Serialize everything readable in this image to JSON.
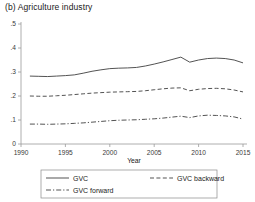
{
  "panel": {
    "label": "(b)  Agriculture industry"
  },
  "chart_data": {
    "type": "line",
    "title": "(b)  Agriculture industry",
    "xlabel": "Year",
    "ylabel": "",
    "xlim": [
      1990,
      2015
    ],
    "ylim": [
      0,
      0.5
    ],
    "grid": false,
    "legend_position": "bottom",
    "xticks": [
      1990,
      1995,
      2000,
      2005,
      2010,
      2015
    ],
    "xtick_labels": [
      "1990",
      "1995",
      "2000",
      "2005",
      "2010",
      "2015"
    ],
    "yticks": [
      0,
      0.1,
      0.2,
      0.3,
      0.4,
      0.5
    ],
    "ytick_labels": [
      "0",
      ".1",
      ".2",
      ".3",
      ".4",
      ".5"
    ],
    "x": [
      1991,
      1992,
      1993,
      1994,
      1995,
      1996,
      1997,
      1998,
      1999,
      2000,
      2001,
      2002,
      2003,
      2004,
      2005,
      2006,
      2007,
      2008,
      2009,
      2010,
      2011,
      2012,
      2013,
      2014,
      2015
    ],
    "series": [
      {
        "name": "GVC",
        "style": "solid",
        "values": [
          0.283,
          0.282,
          0.281,
          0.283,
          0.285,
          0.288,
          0.295,
          0.303,
          0.309,
          0.314,
          0.316,
          0.317,
          0.319,
          0.325,
          0.333,
          0.342,
          0.352,
          0.362,
          0.341,
          0.35,
          0.356,
          0.358,
          0.356,
          0.35,
          0.338
        ]
      },
      {
        "name": "GVC backward",
        "style": "dashed",
        "values": [
          0.2,
          0.199,
          0.199,
          0.201,
          0.203,
          0.206,
          0.209,
          0.212,
          0.214,
          0.216,
          0.217,
          0.218,
          0.219,
          0.222,
          0.226,
          0.23,
          0.233,
          0.234,
          0.222,
          0.228,
          0.231,
          0.232,
          0.23,
          0.225,
          0.217
        ]
      },
      {
        "name": "GVC forward",
        "style": "dashdot",
        "values": [
          0.083,
          0.083,
          0.082,
          0.083,
          0.084,
          0.086,
          0.088,
          0.091,
          0.094,
          0.097,
          0.099,
          0.1,
          0.101,
          0.103,
          0.105,
          0.108,
          0.112,
          0.116,
          0.11,
          0.117,
          0.12,
          0.119,
          0.117,
          0.113,
          0.104
        ]
      }
    ]
  },
  "legend": {
    "items": [
      {
        "label": "GVC",
        "style": "solid"
      },
      {
        "label": "GVC backward",
        "style": "dashed"
      },
      {
        "label": "GVC forward",
        "style": "dashdot"
      }
    ]
  }
}
